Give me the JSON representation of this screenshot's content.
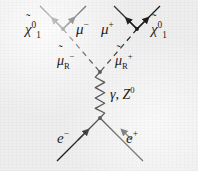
{
  "figure": {
    "kind": "feynman-diagram",
    "background_color": "#eeeeee",
    "line_color": "#1c1c1c",
    "caption": "",
    "process": "e- e+ -> smuon_R- smuon_R+ -> mu- mu+ neutralino1 neutralino1"
  },
  "labels": {
    "neutralino_left": {
      "base": "χ",
      "tilde": "̃",
      "sup": "0",
      "sub": "1",
      "plain": "χ̃1⁰"
    },
    "muon_minus": {
      "base": "μ",
      "sup": "−",
      "plain": "μ−"
    },
    "muon_plus": {
      "base": "μ",
      "sup": "+",
      "plain": "μ+"
    },
    "neutralino_right": {
      "base": "χ",
      "tilde": "̃",
      "sup": "0",
      "sub": "1",
      "plain": "χ̃1⁰"
    },
    "smuon_minus": {
      "base": "μ",
      "tilde": "̃",
      "sub": "R",
      "sup": "−",
      "plain": "μ̃R−"
    },
    "smuon_plus": {
      "base": "μ",
      "tilde": "̃",
      "sub": "R",
      "sup": "+",
      "plain": "μ̃R+"
    },
    "boson": {
      "gamma": "γ",
      "separator": ",",
      "zboson": "Z",
      "zsup": "0",
      "plain": "γ, Z⁰"
    },
    "electron": {
      "base": "e",
      "sup": "−",
      "plain": "e−"
    },
    "positron": {
      "base": "e",
      "sup": "+",
      "plain": "e+"
    }
  },
  "diagram_elements": {
    "vertices": [
      {
        "name": "upper-left-vertex",
        "x": 63,
        "y": 29
      },
      {
        "name": "upper-right-vertex",
        "x": 137,
        "y": 29
      },
      {
        "name": "smuon-annihilation-vertex",
        "x": 100,
        "y": 72
      },
      {
        "name": "eplus-eminus-vertex",
        "x": 100,
        "y": 118
      }
    ],
    "propagators": [
      {
        "name": "photon-z-propagator",
        "style": "wavy",
        "from": "smuon-annihilation-vertex",
        "to": "eplus-eminus-vertex"
      },
      {
        "name": "smuon-minus-propagator",
        "style": "dashed",
        "from": "upper-left-vertex",
        "to": "smuon-annihilation-vertex"
      },
      {
        "name": "smuon-plus-propagator",
        "style": "dashed",
        "from": "upper-right-vertex",
        "to": "smuon-annihilation-vertex"
      }
    ],
    "fermion_lines": [
      {
        "name": "neutralino-left-line",
        "style": "solid",
        "arrow": "outgoing-upper-left"
      },
      {
        "name": "muon-minus-line",
        "style": "solid",
        "arrow": "outgoing-upper-right"
      },
      {
        "name": "muon-plus-line",
        "style": "solid",
        "arrow": "outgoing-upper-left"
      },
      {
        "name": "neutralino-right-line",
        "style": "solid",
        "arrow": "outgoing-upper-right"
      },
      {
        "name": "electron-line",
        "style": "solid",
        "arrow": "incoming-upper-right"
      },
      {
        "name": "positron-line",
        "style": "solid",
        "arrow": "incoming-upper-left"
      }
    ]
  }
}
